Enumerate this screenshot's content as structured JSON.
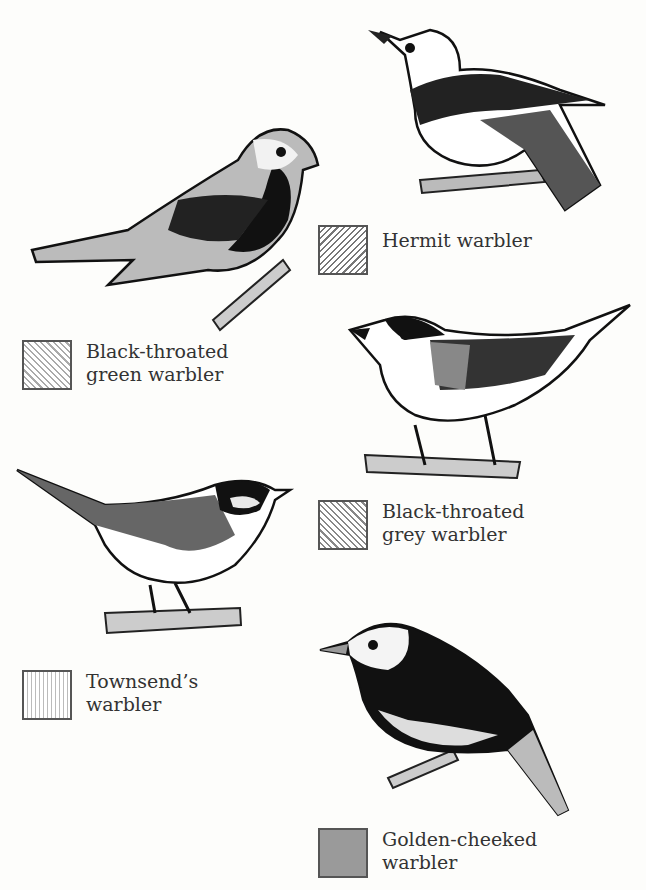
{
  "figure": {
    "species": [
      {
        "id": "hermit",
        "label": "Hermit warbler",
        "pattern": "diagonal-hatch-dense",
        "color": "#777777"
      },
      {
        "id": "black-throated-green",
        "label": "Black-throated\ngreen warbler",
        "pattern": "diagonal-hatch-light",
        "color": "#aaaaaa"
      },
      {
        "id": "black-throated-grey",
        "label": "Black-throated\ngrey warbler",
        "pattern": "diagonal-hatch",
        "color": "#888888"
      },
      {
        "id": "townsends",
        "label": "Townsend’s\nwarbler",
        "pattern": "vertical-lines",
        "color": "#bbbbbb"
      },
      {
        "id": "golden-cheeked",
        "label": "Golden-cheeked\nwarbler",
        "pattern": "solid-grey",
        "color": "#9a9a9a"
      }
    ]
  }
}
